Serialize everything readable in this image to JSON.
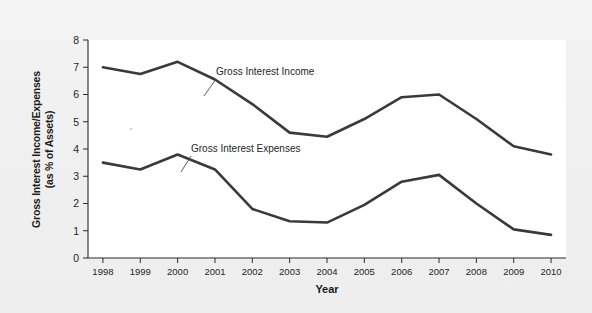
{
  "figure": {
    "background_color": "#f1f1f1",
    "plot_background_color": "#ffffff",
    "line_color": "#3a3a3a",
    "axis_color": "#2b2b2b"
  },
  "chart_data": {
    "type": "line",
    "title": "",
    "xlabel": "Year",
    "ylabel": "Gross Interest Income/Expenses (as % of Assets)",
    "ylabel_line1": "Gross Interest Income/Expenses",
    "ylabel_line2": "(as % of Assets)",
    "categories": [
      "1998",
      "1999",
      "2000",
      "2001",
      "2002",
      "2003",
      "2004",
      "2005",
      "2006",
      "2007",
      "2008",
      "2009",
      "2010"
    ],
    "x": [
      1998,
      1999,
      2000,
      2001,
      2002,
      2003,
      2004,
      2005,
      2006,
      2007,
      2008,
      2009,
      2010
    ],
    "xlim": [
      1997.6,
      2010.4
    ],
    "ylim": [
      0,
      8
    ],
    "yticks": [
      0,
      1,
      2,
      3,
      4,
      5,
      6,
      7,
      8
    ],
    "ytick_labels": [
      "0",
      "1",
      "2",
      "3",
      "4",
      "5",
      "6",
      "7",
      "8"
    ],
    "grid": false,
    "legend": "none",
    "annotations": [
      {
        "text": "Gross Interest Income",
        "series": "Gross Interest Income",
        "points_to_year": 2001
      },
      {
        "text": "Gross Interest Expenses",
        "series": "Gross Interest Expenses",
        "points_to_year": 2000
      }
    ],
    "series": [
      {
        "name": "Gross Interest Income",
        "values": [
          7.0,
          6.75,
          7.2,
          6.55,
          5.65,
          4.6,
          4.45,
          5.1,
          5.9,
          6.0,
          5.1,
          4.1,
          3.8
        ]
      },
      {
        "name": "Gross Interest Expenses",
        "values": [
          3.5,
          3.25,
          3.8,
          3.25,
          1.8,
          1.35,
          1.3,
          1.95,
          2.8,
          3.05,
          2.0,
          1.05,
          0.85
        ]
      }
    ]
  }
}
